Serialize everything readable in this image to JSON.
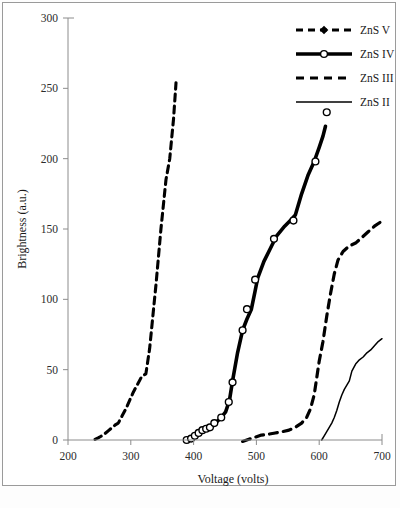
{
  "figure": {
    "background_color": "#ffffff",
    "frame_color": "#9a9a9a",
    "ink_color": "#000000"
  },
  "chart_data": {
    "type": "line",
    "title": "",
    "subtitle": "",
    "xlabel": "Voltage (volts)",
    "ylabel": "Brightness (a.u.)",
    "xlim": [
      200,
      700
    ],
    "ylim": [
      0,
      300
    ],
    "xticks": [
      200,
      300,
      400,
      500,
      600,
      700
    ],
    "yticks": [
      0,
      50,
      100,
      150,
      200,
      250,
      300
    ],
    "xtick_labels": [
      "200",
      "300",
      "400",
      "500",
      "600",
      "700"
    ],
    "ytick_labels": [
      "0",
      "50",
      "100",
      "150",
      "200",
      "250",
      "300"
    ],
    "grid": false,
    "legend_position": "top-right",
    "series": [
      {
        "name": "ZnS V",
        "style": "dashed",
        "marker": "filled-diamond",
        "stroke_width": 3.1,
        "dash": "7,5",
        "line": [
          [
            243,
            0.5
          ],
          [
            248,
            1.5
          ],
          [
            252,
            2.5
          ],
          [
            256,
            3.5
          ],
          [
            260,
            5
          ],
          [
            264,
            6.5
          ],
          [
            268,
            8
          ],
          [
            272,
            9.5
          ],
          [
            276,
            11
          ],
          [
            280,
            12
          ],
          [
            286,
            17
          ],
          [
            292,
            22
          ],
          [
            298,
            28
          ],
          [
            304,
            34
          ],
          [
            310,
            39
          ],
          [
            316,
            44
          ],
          [
            320,
            46
          ],
          [
            324,
            47
          ],
          [
            330,
            65
          ],
          [
            340,
            110
          ],
          [
            348,
            150
          ],
          [
            356,
            185
          ],
          [
            362,
            200
          ],
          [
            368,
            228
          ],
          [
            372,
            254
          ]
        ],
        "markers": [
          [
            243,
            0.5
          ],
          [
            249,
            2
          ],
          [
            254,
            3
          ],
          [
            259,
            5
          ],
          [
            264,
            7
          ],
          [
            269,
            9
          ],
          [
            274,
            11
          ],
          [
            279,
            12
          ],
          [
            288,
            20
          ],
          [
            300,
            30
          ],
          [
            312,
            39
          ],
          [
            320,
            45
          ],
          [
            324,
            47
          ],
          [
            330,
            65
          ],
          [
            340,
            110
          ],
          [
            347,
            149
          ],
          [
            352,
            178
          ],
          [
            357,
            189
          ],
          [
            360,
            191
          ],
          [
            368,
            228
          ],
          [
            372,
            254
          ]
        ]
      },
      {
        "name": "ZnS IV",
        "style": "solid",
        "marker": "open-circle",
        "stroke_width": 3.6,
        "dash": "none",
        "line": [
          [
            389,
            0
          ],
          [
            394,
            1
          ],
          [
            399,
            2
          ],
          [
            404,
            4
          ],
          [
            409,
            6
          ],
          [
            414,
            7
          ],
          [
            419,
            8
          ],
          [
            424,
            9
          ],
          [
            430,
            11
          ],
          [
            437,
            13
          ],
          [
            444,
            16
          ],
          [
            451,
            20
          ],
          [
            457,
            28
          ],
          [
            462,
            42
          ],
          [
            470,
            62
          ],
          [
            478,
            78
          ],
          [
            485,
            86
          ],
          [
            492,
            93
          ],
          [
            498,
            106
          ],
          [
            502,
            115
          ],
          [
            512,
            127
          ],
          [
            522,
            136
          ],
          [
            532,
            145
          ],
          [
            545,
            152
          ],
          [
            556,
            157
          ],
          [
            562,
            160
          ],
          [
            572,
            175
          ],
          [
            582,
            188
          ],
          [
            592,
            198
          ],
          [
            600,
            208
          ],
          [
            606,
            216
          ],
          [
            610,
            223
          ]
        ],
        "markers": [
          [
            389,
            0
          ],
          [
            396,
            1
          ],
          [
            402,
            3
          ],
          [
            408,
            5
          ],
          [
            414,
            7
          ],
          [
            420,
            8
          ],
          [
            426,
            9
          ],
          [
            433,
            12
          ],
          [
            444,
            16
          ],
          [
            456,
            27
          ],
          [
            462,
            41
          ],
          [
            478,
            78
          ],
          [
            485,
            93
          ],
          [
            498,
            114
          ],
          [
            528,
            143
          ],
          [
            559,
            156
          ],
          [
            594,
            198
          ],
          [
            612,
            233
          ]
        ]
      },
      {
        "name": "ZnS III",
        "style": "dashed",
        "marker": "none",
        "stroke_width": 3.2,
        "dash": "8,6",
        "line": [
          [
            478,
            -1
          ],
          [
            488,
            0.5
          ],
          [
            498,
            2
          ],
          [
            508,
            3.5
          ],
          [
            518,
            4
          ],
          [
            530,
            5
          ],
          [
            542,
            6
          ],
          [
            552,
            7
          ],
          [
            562,
            9
          ],
          [
            572,
            12
          ],
          [
            580,
            16
          ],
          [
            586,
            22
          ],
          [
            592,
            32
          ],
          [
            596,
            44
          ],
          [
            600,
            56
          ],
          [
            606,
            70
          ],
          [
            612,
            88
          ],
          [
            618,
            104
          ],
          [
            624,
            118
          ],
          [
            630,
            128
          ],
          [
            638,
            134
          ],
          [
            648,
            138
          ],
          [
            658,
            140
          ],
          [
            668,
            144
          ],
          [
            678,
            148
          ],
          [
            688,
            152
          ],
          [
            698,
            155
          ]
        ],
        "markers": []
      },
      {
        "name": "ZnS II",
        "style": "solid",
        "marker": "none",
        "stroke_width": 1.5,
        "dash": "none",
        "line": [
          [
            604,
            0
          ],
          [
            608,
            3
          ],
          [
            612,
            6
          ],
          [
            616,
            9
          ],
          [
            620,
            12
          ],
          [
            624,
            16
          ],
          [
            628,
            21
          ],
          [
            632,
            27
          ],
          [
            636,
            32
          ],
          [
            640,
            36
          ],
          [
            644,
            39
          ],
          [
            648,
            42
          ],
          [
            652,
            49
          ],
          [
            658,
            54
          ],
          [
            664,
            57
          ],
          [
            670,
            59
          ],
          [
            676,
            62
          ],
          [
            682,
            64
          ],
          [
            688,
            67
          ],
          [
            694,
            70
          ],
          [
            700,
            72
          ]
        ],
        "markers": []
      }
    ],
    "annotations": [
      {
        "label": "detached open circle marker (ZnS IV highest point)",
        "x": 612,
        "y": 233
      }
    ]
  },
  "legend": {
    "entries": [
      {
        "label": "ZnS V",
        "style": "dashed",
        "marker": "filled-diamond"
      },
      {
        "label": "ZnS IV",
        "style": "solid",
        "marker": "open-circle"
      },
      {
        "label": "ZnS III",
        "style": "dashed",
        "marker": "none"
      },
      {
        "label": "ZnS II",
        "style": "thin-solid",
        "marker": "none"
      }
    ]
  }
}
